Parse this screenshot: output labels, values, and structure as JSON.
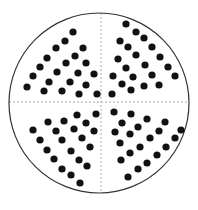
{
  "diagram": {
    "type": "circular-dot-pattern",
    "circle": {
      "cx": 99,
      "cy": 103,
      "r": 90,
      "stroke": "#333333"
    },
    "dividers": {
      "stroke": "#aaaaaa",
      "dash": "2,2",
      "horizontal_y": 102,
      "vertical_x": 101
    },
    "dot_radius": 3.6,
    "dot_color": "#111111",
    "quadrants": [
      {
        "name": "top-left",
        "dots": [
          [
            73,
            32
          ],
          [
            65,
            41
          ],
          [
            56,
            48
          ],
          [
            47,
            58
          ],
          [
            40,
            67
          ],
          [
            33,
            76
          ],
          [
            27,
            87
          ],
          [
            83,
            48
          ],
          [
            75,
            56
          ],
          [
            66,
            63
          ],
          [
            57,
            72
          ],
          [
            49,
            82
          ],
          [
            44,
            91
          ],
          [
            86,
            63
          ],
          [
            78,
            73
          ],
          [
            70,
            82
          ],
          [
            62,
            91
          ],
          [
            94,
            74
          ],
          [
            86,
            85
          ],
          [
            79,
            94
          ],
          [
            97,
            94
          ]
        ]
      },
      {
        "name": "top-right",
        "dots": [
          [
            126,
            24
          ],
          [
            136,
            32
          ],
          [
            144,
            38
          ],
          [
            152,
            47
          ],
          [
            160,
            57
          ],
          [
            168,
            67
          ],
          [
            175,
            76
          ],
          [
            120,
            41
          ],
          [
            128,
            47
          ],
          [
            136,
            55
          ],
          [
            145,
            65
          ],
          [
            152,
            75
          ],
          [
            159,
            85
          ],
          [
            118,
            59
          ],
          [
            126,
            68
          ],
          [
            133,
            77
          ],
          [
            144,
            86
          ],
          [
            113,
            76
          ],
          [
            122,
            84
          ],
          [
            131,
            90
          ],
          [
            112,
            94
          ]
        ]
      },
      {
        "name": "bottom-left",
        "dots": [
          [
            33,
            130
          ],
          [
            40,
            140
          ],
          [
            47,
            150
          ],
          [
            54,
            159
          ],
          [
            62,
            169
          ],
          [
            71,
            175
          ],
          [
            80,
            183
          ],
          [
            48,
            122
          ],
          [
            56,
            131
          ],
          [
            62,
            140
          ],
          [
            71,
            151
          ],
          [
            79,
            160
          ],
          [
            87,
            166
          ],
          [
            64,
            121
          ],
          [
            74,
            129
          ],
          [
            82,
            138
          ],
          [
            90,
            147
          ],
          [
            77,
            115
          ],
          [
            86,
            123
          ],
          [
            94,
            131
          ],
          [
            96,
            114
          ]
        ]
      },
      {
        "name": "bottom-right",
        "dots": [
          [
            114,
            112
          ],
          [
            131,
            114
          ],
          [
            147,
            119
          ],
          [
            165,
            122
          ],
          [
            181,
            130
          ],
          [
            122,
            123
          ],
          [
            138,
            127
          ],
          [
            159,
            131
          ],
          [
            175,
            138
          ],
          [
            115,
            132
          ],
          [
            130,
            134
          ],
          [
            150,
            138
          ],
          [
            166,
            147
          ],
          [
            120,
            143
          ],
          [
            140,
            147
          ],
          [
            157,
            155
          ],
          [
            130,
            153
          ],
          [
            121,
            160
          ],
          [
            147,
            163
          ],
          [
            138,
            169
          ],
          [
            128,
            177
          ]
        ]
      }
    ]
  }
}
